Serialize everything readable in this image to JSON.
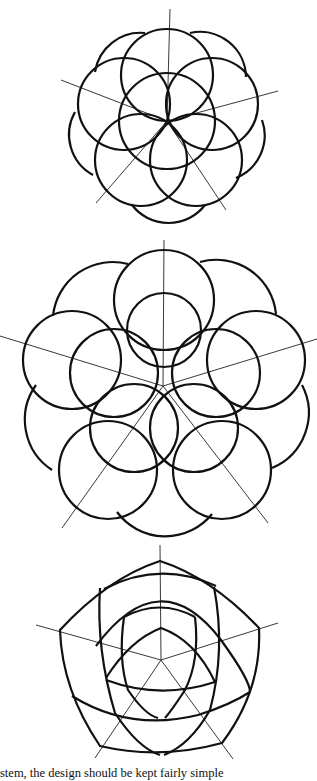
{
  "figures": [
    {
      "name": "overlapping-circles-rosette",
      "center": [
        167,
        121
      ],
      "petals": 5
    },
    {
      "name": "ten-circle-rosette",
      "center": [
        163,
        386
      ],
      "petals": 5
    },
    {
      "name": "curved-pentagon-lattice",
      "center": [
        161,
        660
      ],
      "petals": 5
    }
  ],
  "caption": {
    "text": "stem, the design should be kept fairly simple"
  },
  "colors": {
    "stroke": "#111111",
    "background": "#ffffff"
  }
}
